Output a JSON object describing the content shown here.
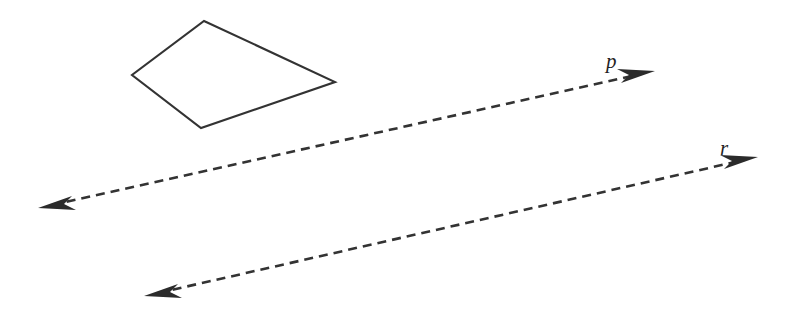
{
  "canvas": {
    "width": 792,
    "height": 312,
    "background_color": "#ffffff",
    "stroke_color": "#333333",
    "label_color": "#1f1f1f"
  },
  "figure": {
    "type": "geometry-diagram"
  },
  "quadrilateral": {
    "name": "quadrilateral",
    "stroke_color": "#333333",
    "stroke_width": 2.1,
    "fill": "none",
    "vertices": [
      {
        "label": "top",
        "x": 204,
        "y": 21
      },
      {
        "label": "right",
        "x": 335,
        "y": 82
      },
      {
        "label": "bottom",
        "x": 201,
        "y": 128
      },
      {
        "label": "left",
        "x": 132,
        "y": 75
      }
    ],
    "points_attr": "204,21 335,82 201,128 132,75"
  },
  "lines": [
    {
      "id": "line-p",
      "label": "p",
      "style": "dashed",
      "stroke_color": "#333333",
      "stroke_width": 2.6,
      "dash_pattern": "9 6",
      "arrowheads": "both",
      "start": {
        "x": 38,
        "y": 208
      },
      "end": {
        "x": 655,
        "y": 71
      },
      "path_d": "M 52 205 L 641 74",
      "label_x": 606,
      "label_y": 68
    },
    {
      "id": "line-r",
      "label": "r",
      "style": "dashed",
      "stroke_color": "#333333",
      "stroke_width": 2.6,
      "dash_pattern": "9 6",
      "arrowheads": "both",
      "start": {
        "x": 144,
        "y": 296
      },
      "end": {
        "x": 758,
        "y": 157
      },
      "path_d": "M 158 293 L 744 160",
      "label_x": 720,
      "label_y": 155
    }
  ],
  "arrowheads": [
    {
      "id": "arrow-p-left",
      "for_line": "p",
      "direction": "left",
      "points_attr": "38,208 72,196 64,204 76,210"
    },
    {
      "id": "arrow-p-right",
      "for_line": "p",
      "direction": "right",
      "points_attr": "655,71 621,83 629,75 617,69"
    },
    {
      "id": "arrow-r-left",
      "for_line": "r",
      "direction": "left",
      "points_attr": "144,296 178,284 170,292 182,298"
    },
    {
      "id": "arrow-r-right",
      "for_line": "r",
      "direction": "right",
      "points_attr": "758,157 724,169 732,161 720,155"
    }
  ]
}
